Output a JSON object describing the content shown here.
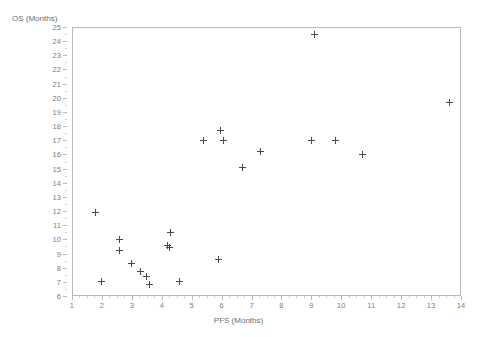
{
  "chart_data": {
    "type": "scatter",
    "title": "",
    "xlabel": "PFS (Months)",
    "ylabel": "OS (Months)",
    "xlim": [
      1,
      14
    ],
    "ylim": [
      6,
      25
    ],
    "grid": false,
    "legend": null,
    "marker": "plus",
    "marker_color": "#4a4a4a",
    "xticks": [
      1,
      2,
      3,
      4,
      5,
      6,
      7,
      8,
      9,
      10,
      11,
      12,
      13,
      14
    ],
    "yticks": [
      6,
      7,
      8,
      9,
      10,
      11,
      12,
      13,
      14,
      15,
      16,
      17,
      18,
      19,
      20,
      21,
      22,
      23,
      24,
      25
    ],
    "xtick_labels": [
      "1",
      "2",
      "3",
      "4",
      "5",
      "6",
      "7",
      "8",
      "9",
      "10",
      "11",
      "12",
      "13",
      "14"
    ],
    "ytick_labels": [
      "6",
      "7",
      "8",
      "9",
      "10",
      "11",
      "12",
      "13",
      "14",
      "15",
      "16",
      "17",
      "18",
      "19",
      "20",
      "21",
      "22",
      "23",
      "24",
      "25"
    ],
    "points": [
      {
        "x": 1.8,
        "y": 11.9
      },
      {
        "x": 2.0,
        "y": 7.0
      },
      {
        "x": 2.6,
        "y": 10.0
      },
      {
        "x": 2.6,
        "y": 9.2
      },
      {
        "x": 3.0,
        "y": 8.3
      },
      {
        "x": 3.3,
        "y": 7.7
      },
      {
        "x": 3.5,
        "y": 7.4
      },
      {
        "x": 3.6,
        "y": 6.8
      },
      {
        "x": 4.2,
        "y": 9.6
      },
      {
        "x": 4.25,
        "y": 9.4
      },
      {
        "x": 4.3,
        "y": 10.5
      },
      {
        "x": 4.6,
        "y": 7.0
      },
      {
        "x": 5.4,
        "y": 17.0
      },
      {
        "x": 5.95,
        "y": 17.7
      },
      {
        "x": 6.05,
        "y": 17.0
      },
      {
        "x": 5.9,
        "y": 8.6
      },
      {
        "x": 6.7,
        "y": 15.1
      },
      {
        "x": 7.3,
        "y": 16.2
      },
      {
        "x": 9.0,
        "y": 17.0
      },
      {
        "x": 9.1,
        "y": 24.5
      },
      {
        "x": 9.8,
        "y": 17.0
      },
      {
        "x": 10.7,
        "y": 16.0
      },
      {
        "x": 13.6,
        "y": 19.7
      }
    ]
  }
}
